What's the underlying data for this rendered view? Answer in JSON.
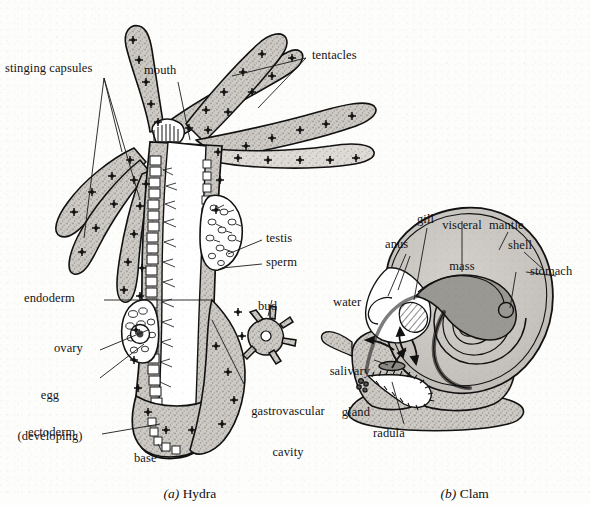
{
  "figure": {
    "panels": [
      {
        "id": "a",
        "marker": "(a)",
        "title": "Hydra"
      },
      {
        "id": "b",
        "marker": "(b)",
        "title": "Clam"
      }
    ]
  },
  "hydra": {
    "labels": {
      "stinging_capsules": "stinging capsules",
      "mouth": "mouth",
      "tentacles": "tentacles",
      "testis": "testis",
      "sperm": "sperm",
      "endoderm": "endoderm",
      "bud": "bud",
      "ovary": "ovary",
      "egg_line1": "egg",
      "egg_line2": "(developing)",
      "gastrovascular_line1": "gastrovascular",
      "gastrovascular_line2": "cavity",
      "ectoderm": "ectoderm",
      "base": "base"
    }
  },
  "clam": {
    "labels": {
      "visceral_line1": "visceral",
      "visceral_line2": "mass",
      "gill": "gill",
      "mantle": "mantle",
      "anus": "anus",
      "shell": "shell",
      "stomach": "stomach",
      "water": "water",
      "salivary_line1": "salivary",
      "salivary_line2": "gland",
      "radula": "radula"
    }
  },
  "colors": {
    "background": "#fdfdfc",
    "ink": "#141414",
    "tissue_fill": "#c9c7c2",
    "tissue_fill_light": "#d8d6d1",
    "organ_fill": "#9a9892",
    "organ_fill_dark": "#8b8984",
    "cavity_fill": "#ffffff",
    "leader_line": "#1a1a1a"
  }
}
